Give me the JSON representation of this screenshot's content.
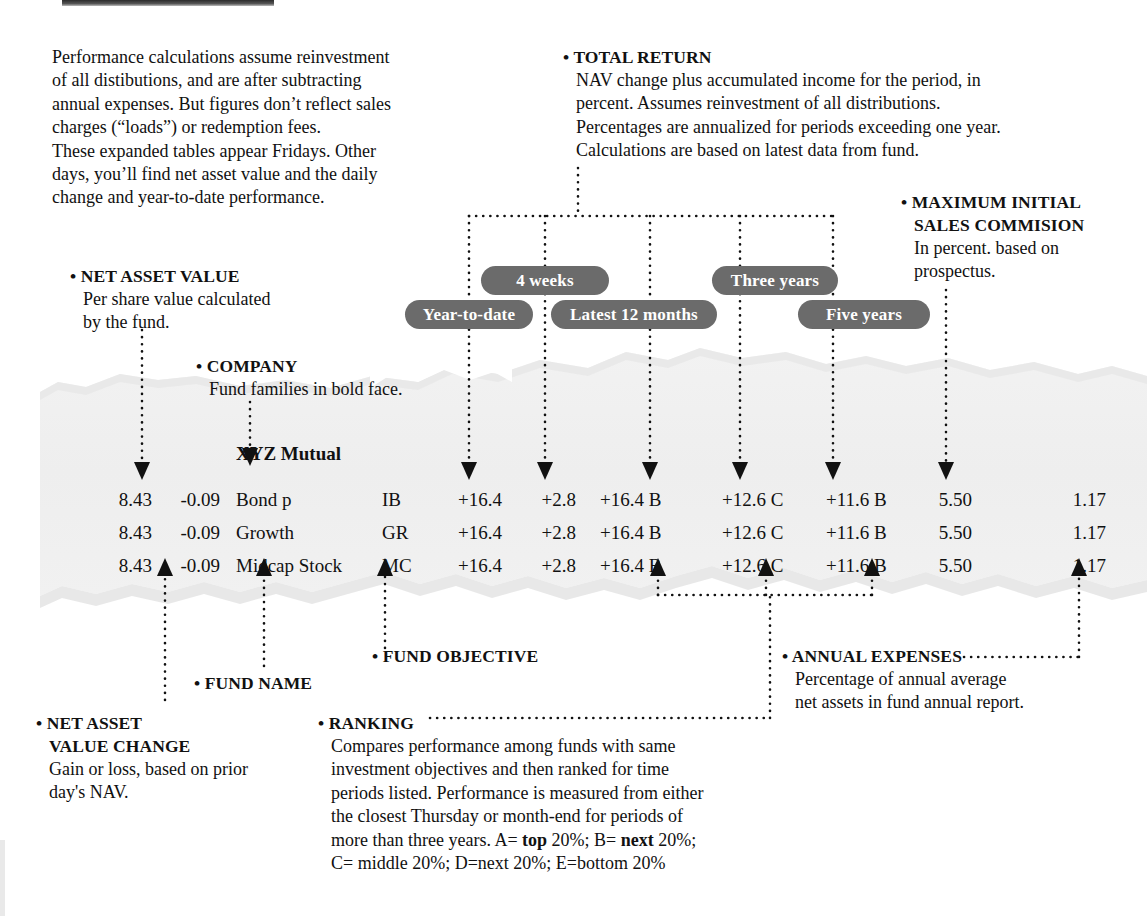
{
  "meta": {
    "paper_color": "#efefef",
    "paper_edge_color": "#e2e2e2",
    "pill_color": "#6b6b6b",
    "pill_text_color": "#ffffff",
    "ink_color": "#111111"
  },
  "callouts": {
    "intro": {
      "lines": [
        "Performance calculations assume reinvestment",
        "of all distibutions, and are after subtracting",
        "annual expenses. But figures don’t reflect sales",
        "charges (“loads”) or redemption fees.",
        "These expanded tables appear Fridays. Other",
        "days, you’ll find net asset value and the daily",
        "change and year-to-date performance."
      ]
    },
    "total_return": {
      "bullet": "•",
      "heading": "TOTAL RETURN",
      "lines": [
        "NAV change plus accumulated income for the period, in",
        "percent. Assumes reinvestment of all distributions.",
        "Percentages are annualized for periods exceeding one year.",
        "Calculations are based on latest data from fund."
      ]
    },
    "max_initial_sales": {
      "bullet": "•",
      "heading_line1": "MAXIMUM INITIAL",
      "heading_line2": "SALES COMMISION",
      "lines": [
        "In percent. based on",
        "prospectus."
      ]
    },
    "net_asset_value": {
      "bullet": "•",
      "heading": "NET ASSET VALUE",
      "lines": [
        "Per share value calculated",
        "by the fund."
      ]
    },
    "company": {
      "bullet": "•",
      "heading": "COMPANY",
      "lines": [
        "Fund families in bold face."
      ]
    },
    "fund_objective": {
      "bullet": "•",
      "heading": "FUND OBJECTIVE"
    },
    "fund_name": {
      "bullet": "•",
      "heading": "FUND NAME"
    },
    "nav_change": {
      "bullet": "•",
      "heading_line1": "NET ASSET",
      "heading_line2": "VALUE CHANGE",
      "lines": [
        "Gain or loss, based on prior",
        "day's NAV."
      ]
    },
    "ranking": {
      "bullet": "•",
      "heading": "RANKING",
      "line1": "Compares performance among funds with same",
      "line2": "investment objectives and then ranked for time",
      "line3": "periods listed. Performance is measured from either",
      "line4": "the closest Thursday or month-end for periods of",
      "line5_pre": "more than three years. A= ",
      "line5_b1": "top",
      "line5_mid": " 20%; B= ",
      "line5_b2": "next",
      "line5_post": " 20%;",
      "line6": "C= middle 20%; D=next 20%; E=bottom 20%"
    },
    "annual_expenses": {
      "bullet": "•",
      "heading": "ANNUAL EXPENSES",
      "lines": [
        "Percentage of annual average",
        "net assets in fund annual report."
      ]
    }
  },
  "pills": [
    {
      "id": "year-to-date",
      "label": "Year-to-date"
    },
    {
      "id": "four-weeks",
      "label": "4 weeks"
    },
    {
      "id": "latest-12-months",
      "label": "Latest 12 months"
    },
    {
      "id": "three-years",
      "label": "Three years"
    },
    {
      "id": "five-years",
      "label": "Five years"
    }
  ],
  "table": {
    "company_name": "XYZ Mutual",
    "columns": [
      "nav",
      "nav_change",
      "fund_name",
      "objective",
      "ytd",
      "four_weeks",
      "latest_12_months",
      "three_years",
      "five_years",
      "sales_commission",
      "annual_expenses"
    ],
    "rows": [
      {
        "nav": "8.43",
        "nav_change": "-0.09",
        "fund_name": "Bond p",
        "objective": "IB",
        "ytd": "+16.4",
        "four_weeks": "+2.8",
        "latest_12_months": "+16.4 B",
        "three_years": "+12.6 C",
        "five_years": "+11.6 B",
        "sales_commission": "5.50",
        "annual_expenses": "1.17"
      },
      {
        "nav": "8.43",
        "nav_change": "-0.09",
        "fund_name": "Growth",
        "objective": "GR",
        "ytd": "+16.4",
        "four_weeks": "+2.8",
        "latest_12_months": "+16.4 B",
        "three_years": "+12.6 C",
        "five_years": "+11.6 B",
        "sales_commission": "5.50",
        "annual_expenses": "1.17"
      },
      {
        "nav": "8.43",
        "nav_change": "-0.09",
        "fund_name": "Midcap Stock",
        "objective": "MC",
        "ytd": "+16.4",
        "four_weeks": "+2.8",
        "latest_12_months": "+16.4 B",
        "three_years": "+12.6 C",
        "five_years": "+11.6 B",
        "sales_commission": "5.50",
        "annual_expenses": "1.17"
      }
    ]
  }
}
